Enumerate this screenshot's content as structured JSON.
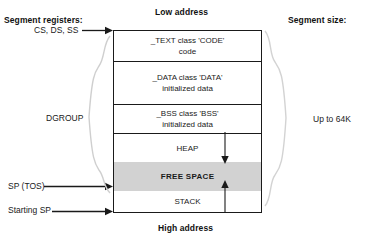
{
  "diagram": {
    "title_low": "Low address",
    "title_high": "High address",
    "left_heading": "Segment registers:",
    "right_heading": "Segment size:",
    "segments": [
      {
        "id": "text",
        "line1": "_TEXT class 'CODE'",
        "line2": "code"
      },
      {
        "id": "data",
        "line1": "_DATA class 'DATA'",
        "line2": "initialized data"
      },
      {
        "id": "bss",
        "line1": "_BSS class 'BSS'",
        "line2": "initialized data"
      },
      {
        "id": "heap",
        "line1": "HEAP",
        "line2": ""
      },
      {
        "id": "freespace",
        "line1": "FREE SPACE",
        "line2": ""
      },
      {
        "id": "stack",
        "line1": "STACK",
        "line2": ""
      }
    ],
    "pointers": {
      "segment_registers": "CS, DS, SS",
      "dgroup": "DGROUP",
      "stack_pointer": "SP (TOS)",
      "starting_stack_pointer": "Starting SP"
    },
    "size_note": "Up to 64K",
    "colors": {
      "free_space_fill": "#d2d2d2",
      "line": "#1a1a1a",
      "background": "#ffffff"
    }
  }
}
